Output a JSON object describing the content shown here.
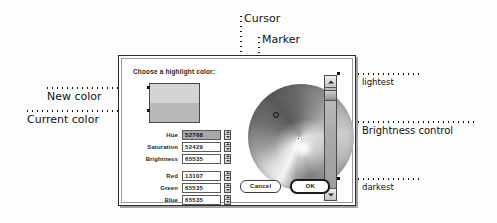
{
  "dialog": {
    "title": "Choose a highlight color:",
    "swatch": {
      "new_color_label": "New color",
      "current_color_label": "Current color",
      "new_color_hex": "#d4d4d4",
      "current_color_hex": "#b9b9b9"
    },
    "hsb_fields": [
      {
        "label": "Hue",
        "value": "52768",
        "selected": true
      },
      {
        "label": "Saturation",
        "value": "52429",
        "selected": false
      },
      {
        "label": "Brightness",
        "value": "65535",
        "selected": false
      }
    ],
    "rgb_fields": [
      {
        "label": "Red",
        "value": "13107",
        "selected": false
      },
      {
        "label": "Green",
        "value": "65535",
        "selected": false
      },
      {
        "label": "Blue",
        "value": "65535",
        "selected": false
      }
    ],
    "buttons": {
      "cancel": "Cancel",
      "ok": "OK"
    },
    "slider": {
      "up_icon": "triangle-up-icon",
      "down_icon": "triangle-down-icon"
    },
    "wheel": {
      "cursor_icon": "ring-cursor-icon",
      "marker_icon": "square-marker-icon"
    }
  },
  "annotations": {
    "cursor": "Cursor",
    "marker": "Marker",
    "new_color": "New color",
    "current_color": "Current color",
    "lightest": "lightest",
    "brightness_control": "Brightness control",
    "darkest": "darkest"
  }
}
